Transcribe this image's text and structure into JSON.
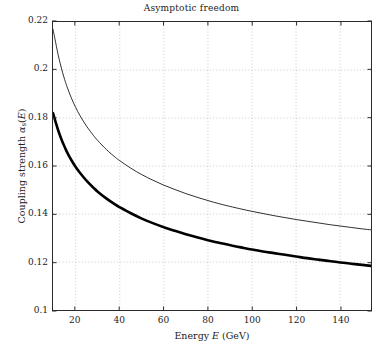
{
  "chart_data": {
    "type": "line",
    "title": "Asymptotic freedom",
    "xlabel": "Energy E (GeV)",
    "ylabel": "Coupling strength αs(E)",
    "xlim": [
      9.7,
      154.0
    ],
    "ylim": [
      0.1,
      0.22
    ],
    "xticks": [
      20,
      40,
      60,
      80,
      100,
      120,
      140
    ],
    "xtick_labels": [
      "20",
      "40",
      "60",
      "80",
      "100",
      "120",
      "140"
    ],
    "yticks": [
      0.1,
      0.12,
      0.14,
      0.16,
      0.18,
      0.2,
      0.22
    ],
    "ytick_labels": [
      "0.1",
      "0.12",
      "0.14",
      "0.16",
      "0.18",
      "0.2",
      "0.22"
    ],
    "grid": true,
    "grid_style": "dotted",
    "grid_color": "#bdbdbd",
    "legend": "none",
    "background": "#ffffff",
    "axis_color": "#2b2b2b",
    "series": [
      {
        "name": "upper-curve",
        "style": "thin",
        "color": "#1a1a1a",
        "linewidth": 0.9,
        "x": [
          9.7,
          11,
          12,
          13,
          14,
          15,
          16,
          18,
          20,
          22,
          25,
          28,
          30,
          34,
          38,
          40,
          45,
          50,
          55,
          60,
          65,
          70,
          75,
          80,
          85,
          91.2,
          95,
          100,
          105,
          110,
          115,
          120,
          125,
          130,
          135,
          140,
          145,
          150,
          154
        ],
        "y": [
          0.217,
          0.211,
          0.2065,
          0.2026,
          0.1991,
          0.196,
          0.1932,
          0.1884,
          0.1844,
          0.1809,
          0.1765,
          0.1728,
          0.1706,
          0.1668,
          0.1636,
          0.1622,
          0.1591,
          0.1564,
          0.1541,
          0.152,
          0.1502,
          0.1485,
          0.147,
          0.1456,
          0.1443,
          0.1429,
          0.1421,
          0.1411,
          0.1402,
          0.1393,
          0.1385,
          0.1377,
          0.137,
          0.1363,
          0.1356,
          0.135,
          0.1344,
          0.1338,
          0.1334
        ]
      },
      {
        "name": "lower-curve",
        "style": "thick",
        "color": "#000000",
        "linewidth": 2.6,
        "x": [
          9.7,
          11,
          12,
          13,
          14,
          15,
          16,
          18,
          20,
          22,
          25,
          28,
          30,
          34,
          38,
          40,
          45,
          50,
          55,
          60,
          65,
          70,
          75,
          80,
          85,
          91.2,
          95,
          100,
          105,
          110,
          115,
          120,
          125,
          130,
          135,
          140,
          145,
          150,
          154
        ],
        "y": [
          0.182,
          0.178,
          0.175,
          0.1724,
          0.17,
          0.1679,
          0.1659,
          0.1625,
          0.1596,
          0.1571,
          0.1538,
          0.151,
          0.1493,
          0.1464,
          0.1439,
          0.1428,
          0.1403,
          0.1381,
          0.1362,
          0.1345,
          0.133,
          0.1316,
          0.1303,
          0.1291,
          0.128,
          0.1268,
          0.1261,
          0.1252,
          0.1244,
          0.1237,
          0.123,
          0.1223,
          0.1216,
          0.121,
          0.1204,
          0.1198,
          0.1193,
          0.1188,
          0.1184
        ]
      }
    ]
  },
  "axis_titles": {
    "x_prefix": "Energy ",
    "x_var": "E",
    "x_suffix": " (GeV)",
    "y_prefix": "Coupling strength ",
    "y_alpha": "α",
    "y_sub": "s",
    "y_open": "(",
    "y_var": "E",
    "y_close": ")"
  }
}
